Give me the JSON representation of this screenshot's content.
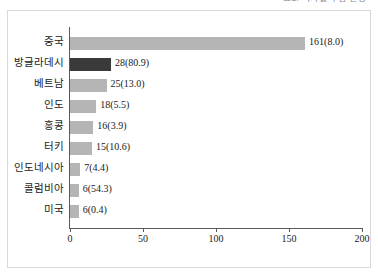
{
  "header": {
    "clipped_text": "표2. 국가별 수입 현황"
  },
  "chart_data": {
    "type": "bar",
    "orientation": "horizontal",
    "title": "",
    "xlabel": "",
    "ylabel": "",
    "xlim": [
      0,
      200
    ],
    "xticks": [
      "0",
      "50",
      "100",
      "150",
      "200"
    ],
    "xtick_values": [
      0,
      50,
      100,
      150,
      200
    ],
    "grid": false,
    "legend": false,
    "categories": [
      "중국",
      "방글라데시",
      "베트남",
      "인도",
      "홍콩",
      "터키",
      "인도네시아",
      "콜럼비아",
      "미국"
    ],
    "values": [
      161,
      28,
      25,
      18,
      16,
      15,
      7,
      6,
      6
    ],
    "secondary_values": [
      8.0,
      80.9,
      13.0,
      5.5,
      3.9,
      10.6,
      4.4,
      54.3,
      0.4
    ],
    "data_labels": [
      "161(8.0)",
      "28(80.9)",
      "25(13.0)",
      "18(5.5)",
      "16(3.9)",
      "15(10.6)",
      "7(4.4)",
      "6(54.3)",
      "6(0.4)"
    ],
    "highlight_index": 1,
    "colors": {
      "bar": "#b5b5b5",
      "bar_highlight": "#3a3a3a",
      "axis": "#5a5a5a",
      "frame": "#d9d9d9",
      "text": "#1a1a1a"
    }
  }
}
